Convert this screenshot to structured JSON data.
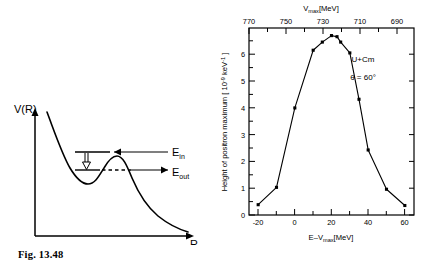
{
  "figures": [
    {
      "id": "fig-13-48",
      "caption": "Fig. 13.48",
      "type": "diagram",
      "title": "Potential energy curve with barrier",
      "axes": {
        "y_label": "V(R)",
        "x_label": "R"
      },
      "annotations": [
        {
          "name": "energy-in",
          "base": "E",
          "subscript": "in",
          "label": "E_in"
        },
        {
          "name": "energy-out",
          "base": "E",
          "subscript": "out",
          "label": "E_out"
        }
      ]
    },
    {
      "id": "fig-13-49",
      "caption": "Fig. 13.49",
      "type": "chart"
    }
  ],
  "chart_data": {
    "type": "line",
    "title": "",
    "xlabel_parts": {
      "base": "E–V",
      "subscript": "max",
      "units": "[MeV]"
    },
    "xlabel": "E-Vmax [MeV]",
    "ylabel_parts": {
      "text": "Height of positron maximum [ 10",
      "exponent": "-9",
      "mid": " keV",
      "exponent2": "-1",
      "tail": " ]"
    },
    "ylabel": "Height of positron maximum [10-9 keV-1]",
    "top_axis_label_parts": {
      "base": "V",
      "subscript": "max",
      "units": "[MeV]"
    },
    "top_axis_label": "Vmax [MeV]",
    "xlim": [
      -25,
      65
    ],
    "ylim": [
      0,
      6.9
    ],
    "xticks": [
      -20,
      0,
      20,
      40,
      60
    ],
    "xtick_labels": [
      "-20",
      "0",
      "20",
      "40",
      "60"
    ],
    "xminorticks": [
      -10,
      10,
      30,
      50
    ],
    "yticks": [
      0,
      1,
      2,
      3,
      4,
      5,
      6
    ],
    "ytick_labels": [
      "0",
      "1",
      "2",
      "3",
      "4",
      "5",
      "6"
    ],
    "top_xticks": [
      770,
      750,
      730,
      710,
      690
    ],
    "top_xtick_labels": [
      "770",
      "750",
      "730",
      "710",
      "690"
    ],
    "top_axis_direction": "decreasing",
    "top_axis_note": "V_max = 750 - (E - V_max)",
    "grid": false,
    "legend": "none",
    "marker": "filled-square",
    "x": [
      -20,
      -10,
      0,
      10,
      15,
      20,
      23,
      25,
      30,
      35,
      40,
      50,
      60
    ],
    "values": [
      0.38,
      1.02,
      3.95,
      6.08,
      6.38,
      6.62,
      6.58,
      6.38,
      5.98,
      4.27,
      2.4,
      0.95,
      0.35
    ],
    "points": [
      {
        "x": -20,
        "y": 0.38
      },
      {
        "x": -10,
        "y": 1.02
      },
      {
        "x": 0,
        "y": 3.95
      },
      {
        "x": 10,
        "y": 6.08
      },
      {
        "x": 15,
        "y": 6.38
      },
      {
        "x": 20,
        "y": 6.62
      },
      {
        "x": 23,
        "y": 6.58
      },
      {
        "x": 25,
        "y": 6.38
      },
      {
        "x": 30,
        "y": 5.98
      },
      {
        "x": 35,
        "y": 4.27
      },
      {
        "x": 40,
        "y": 2.4
      },
      {
        "x": 50,
        "y": 0.95
      },
      {
        "x": 60,
        "y": 0.35
      }
    ],
    "annotations": [
      {
        "name": "system-label",
        "text": "U+Cm"
      },
      {
        "name": "angle-label",
        "base": "θ = 60",
        "unit": "°",
        "text": "θ=60°"
      }
    ],
    "colors": {
      "line": "#000000",
      "marker": "#000000",
      "axis": "#000000",
      "background": "#ffffff"
    }
  }
}
